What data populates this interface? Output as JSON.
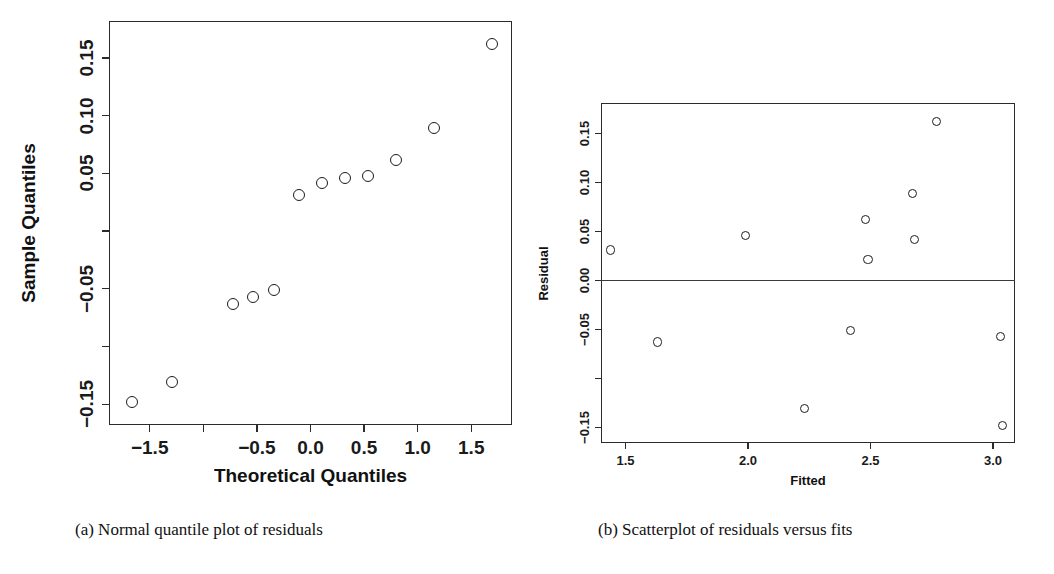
{
  "figure": {
    "panels": [
      {
        "id": "a",
        "caption": "(a) Normal quantile plot of residuals",
        "caption_label": "(a)"
      },
      {
        "id": "b",
        "caption": "(b) Scatterplot of residuals versus fits",
        "caption_label": "(b)"
      }
    ]
  },
  "chart_data": [
    {
      "type": "scatter",
      "id": "normal-quantile-plot",
      "title": "",
      "xlabel": "Theoretical Quantiles",
      "ylabel": "Sample Quantiles",
      "xlim": [
        -1.88,
        1.88
      ],
      "ylim": [
        -0.168,
        0.182
      ],
      "grid": false,
      "legend": "none",
      "xticks": [
        -1.5,
        -1.0,
        -0.5,
        0.0,
        0.5,
        1.0,
        1.5
      ],
      "xticklabels": [
        "-1.5",
        "",
        "-0.5",
        "0.0",
        "0.5",
        "1.0",
        "1.5"
      ],
      "yticks": [
        0.15,
        0.1,
        0.05,
        0.0,
        -0.05,
        -0.1,
        -0.15
      ],
      "yticklabels": [
        "0.15",
        "0.10",
        "0.05",
        "",
        "-0.05",
        "",
        "-0.15"
      ],
      "marker": "open-circle",
      "x": [
        -1.67,
        -1.29,
        -0.72,
        -0.54,
        -0.34,
        -0.11,
        0.11,
        0.32,
        0.54,
        0.8,
        1.15,
        1.69
      ],
      "y": [
        -0.148,
        -0.131,
        -0.063,
        -0.057,
        -0.051,
        0.031,
        0.042,
        0.046,
        0.048,
        0.062,
        0.089,
        0.162
      ]
    },
    {
      "type": "scatter",
      "id": "residuals-vs-fits-plot",
      "title": "",
      "xlabel": "Fitted",
      "ylabel": "Residual",
      "xlim": [
        1.4,
        3.09
      ],
      "ylim": [
        -0.166,
        0.181
      ],
      "grid": false,
      "legend": "none",
      "xticks": [
        1.5,
        2.0,
        2.5,
        3.0
      ],
      "xticklabels": [
        "1.5",
        "2.0",
        "2.5",
        "3.0"
      ],
      "yticks": [
        0.15,
        0.1,
        0.05,
        0.0,
        -0.05,
        -0.1,
        -0.15
      ],
      "yticklabels": [
        "0.15",
        "0.10",
        "0.05",
        "0.00",
        "-0.05",
        "",
        "-0.15"
      ],
      "marker": "open-circle",
      "hline": 0.0,
      "x": [
        1.44,
        1.63,
        1.99,
        2.23,
        2.42,
        2.48,
        2.49,
        2.67,
        2.68,
        2.77,
        3.03,
        3.04
      ],
      "y": [
        0.031,
        -0.063,
        0.046,
        -0.131,
        -0.051,
        0.062,
        0.021,
        0.089,
        0.042,
        0.162,
        -0.057,
        -0.148
      ]
    }
  ]
}
